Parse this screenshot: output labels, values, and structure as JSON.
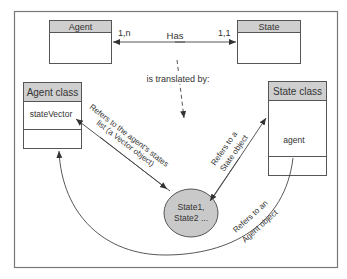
{
  "diagram": {
    "er_model": {
      "entity_left": {
        "title": "Agent"
      },
      "entity_right": {
        "title": "State"
      },
      "relationship": {
        "label": "Has",
        "cardinality_left": "1,n",
        "cardinality_right": "1,1"
      }
    },
    "translation_label": "is translated by:",
    "class_left": {
      "title": "Agent class",
      "attribute": "stateVector"
    },
    "class_right": {
      "title": "State class",
      "attribute": "agent"
    },
    "instances": {
      "line1": "State1,",
      "line2": "State2 ..."
    },
    "arrows": {
      "vector_ref": {
        "line1": "Refers to the agent's states",
        "line2": "list (a Vector object)"
      },
      "state_ref": {
        "line1": "Refers to a",
        "line2": "State object"
      },
      "agent_ref": {
        "line1": "Refers to an",
        "line2": "Agent object"
      }
    },
    "colors": {
      "header_fill": "#cfcfcf",
      "ellipse_fill": "#c9c9c9",
      "line": "#444444",
      "frame": "#777777"
    }
  }
}
